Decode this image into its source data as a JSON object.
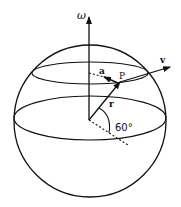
{
  "figure": {
    "labels": {
      "omega": "ω",
      "velocity": "v",
      "acceleration": "a",
      "point": "P",
      "radius": "r",
      "angle": "60°"
    },
    "angle_degrees": 60,
    "colors": {
      "stroke": "#111111",
      "background": "#ffffff"
    }
  }
}
